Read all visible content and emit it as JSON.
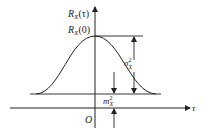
{
  "diagram": {
    "type": "autocorrelation-function-plot",
    "labels": {
      "y_axis": "R",
      "y_axis_sub": "X",
      "y_axis_arg": "(τ)",
      "peak": "R",
      "peak_sub": "X",
      "peak_arg": "(0)",
      "x_axis": "τ",
      "origin": "O",
      "variance": "σ",
      "variance_sup": "2",
      "variance_sub": "X",
      "mean_sq": "m",
      "mean_sq_sup": "2",
      "mean_sq_sub": "X"
    },
    "colors": {
      "stroke": "#222222",
      "background": "#ffffff"
    }
  }
}
